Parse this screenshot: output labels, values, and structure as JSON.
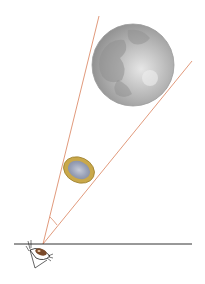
{
  "diagram": {
    "colors": {
      "ray": "#d9805a",
      "horizon": "#333333",
      "moon_light": "#d8d8d8",
      "moon_dark": "#8a8a8a",
      "coin_rim": "#c9a84a",
      "coin_center": "#a9b0c4",
      "eye_iris": "#7a4a2a"
    },
    "elements": [
      "eye",
      "horizon-line",
      "sight-rays",
      "angle-arc",
      "coin",
      "moon"
    ]
  }
}
